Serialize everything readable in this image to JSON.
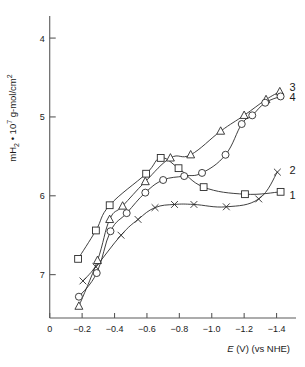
{
  "chart_data": {
    "type": "line",
    "title": "",
    "xlabel": "E (V) (vs NHE)",
    "ylabel": "mH2 • 107 g-mol/cm2",
    "ylabel_parts": {
      "prefix": "mH",
      "sub1": "2",
      "mid": " • 10",
      "sup1": "7",
      "tail": " g-mol/cm",
      "sup2": "2"
    },
    "xlabel_parts": {
      "italic": "E",
      "rest": " (V) (vs NHE)"
    },
    "xticks": [
      "0",
      "−0.2",
      "−0.4",
      "−0.6",
      "−0.8",
      "−1.0",
      "−1.2",
      "−1.4"
    ],
    "xtick_values": [
      0,
      -0.2,
      -0.4,
      -0.6,
      -0.8,
      -1.0,
      -1.2,
      -1.4
    ],
    "yticks": [
      "4",
      "5",
      "6",
      "7"
    ],
    "ytick_values": [
      4,
      5,
      6,
      7
    ],
    "xlim": [
      0.06,
      -1.52
    ],
    "ylim": [
      7.55,
      3.72
    ],
    "y_axis_inverted": true,
    "grid": false,
    "legend_position": "right-of-curve-ends",
    "series": [
      {
        "name": "1",
        "marker": "square",
        "label": "1",
        "label_x": -1.48,
        "label_y": 5.99,
        "points": [
          {
            "x": -0.175,
            "y": 6.8
          },
          {
            "x": -0.285,
            "y": 6.44
          },
          {
            "x": -0.37,
            "y": 6.12
          },
          {
            "x": -0.595,
            "y": 5.72
          },
          {
            "x": -0.685,
            "y": 5.52
          },
          {
            "x": -0.795,
            "y": 5.65
          },
          {
            "x": -0.95,
            "y": 5.89
          },
          {
            "x": -1.205,
            "y": 5.98
          },
          {
            "x": -1.425,
            "y": 5.95
          }
        ]
      },
      {
        "name": "2",
        "marker": "cross",
        "label": "2",
        "label_x": -1.48,
        "label_y": 5.67,
        "points": [
          {
            "x": -0.205,
            "y": 7.08
          },
          {
            "x": -0.285,
            "y": 6.9
          },
          {
            "x": -0.44,
            "y": 6.5
          },
          {
            "x": -0.545,
            "y": 6.3
          },
          {
            "x": -0.65,
            "y": 6.15
          },
          {
            "x": -0.77,
            "y": 6.11
          },
          {
            "x": -0.89,
            "y": 6.11
          },
          {
            "x": -1.09,
            "y": 6.14
          },
          {
            "x": -1.29,
            "y": 6.04
          },
          {
            "x": -1.405,
            "y": 5.7
          }
        ]
      },
      {
        "name": "3",
        "marker": "triangle",
        "label": "3",
        "label_x": -1.48,
        "label_y": 4.62,
        "points": [
          {
            "x": -0.18,
            "y": 7.4
          },
          {
            "x": -0.295,
            "y": 6.82
          },
          {
            "x": -0.37,
            "y": 6.3
          },
          {
            "x": -0.45,
            "y": 6.13
          },
          {
            "x": -0.59,
            "y": 5.82
          },
          {
            "x": -0.745,
            "y": 5.52
          },
          {
            "x": -0.87,
            "y": 5.48
          },
          {
            "x": -1.055,
            "y": 5.18
          },
          {
            "x": -1.2,
            "y": 4.98
          },
          {
            "x": -1.335,
            "y": 4.78
          },
          {
            "x": -1.42,
            "y": 4.68
          }
        ]
      },
      {
        "name": "4",
        "marker": "circle",
        "label": "4",
        "label_x": -1.48,
        "label_y": 4.75,
        "points": [
          {
            "x": -0.18,
            "y": 7.28
          },
          {
            "x": -0.29,
            "y": 6.98
          },
          {
            "x": -0.375,
            "y": 6.45
          },
          {
            "x": -0.475,
            "y": 6.22
          },
          {
            "x": -0.59,
            "y": 5.96
          },
          {
            "x": -0.7,
            "y": 5.8
          },
          {
            "x": -0.83,
            "y": 5.75
          },
          {
            "x": -0.94,
            "y": 5.71
          },
          {
            "x": -1.085,
            "y": 5.48
          },
          {
            "x": -1.185,
            "y": 5.09
          },
          {
            "x": -1.25,
            "y": 4.98
          },
          {
            "x": -1.33,
            "y": 4.82
          },
          {
            "x": -1.425,
            "y": 4.74
          }
        ]
      }
    ]
  }
}
